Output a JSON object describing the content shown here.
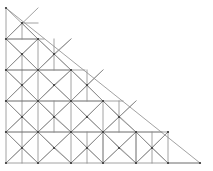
{
  "figure": {
    "name": "triangular-finite-element-mesh",
    "title": "",
    "background_color": "#ffffff",
    "line_color": "#8a8a8a",
    "node_color": "#3a3a3a",
    "line_width": 0.8,
    "node_radius": 1.1,
    "canvas": {
      "width": 213,
      "height": 171
    }
  },
  "mesh": {
    "domain_shape": "right-triangle",
    "apex": [
      6,
      8
    ],
    "bottom_left": [
      6,
      163
    ],
    "bottom_right": [
      200,
      163
    ],
    "grid_cell_width": 32.333,
    "grid_cell_height": 31.0,
    "columns": 6,
    "rows": 5,
    "description": "Unstructured triangular mesh on a right triangular domain, apex top-left, refined with diagonal and sub-diagonal elements",
    "segments": [
      [
        6,
        8,
        6,
        163
      ],
      [
        6,
        163,
        200,
        163
      ],
      [
        6,
        8,
        200,
        163
      ],
      [
        6,
        39,
        44,
        39
      ],
      [
        6,
        70,
        85,
        70
      ],
      [
        6,
        101,
        123,
        101
      ],
      [
        6,
        132,
        162,
        132
      ],
      [
        38,
        39,
        38,
        163
      ],
      [
        71,
        70,
        71,
        163
      ],
      [
        103,
        101,
        103,
        163
      ],
      [
        136,
        132,
        136,
        163
      ],
      [
        168,
        163,
        168,
        163
      ],
      [
        6,
        8,
        38,
        39
      ],
      [
        6,
        39,
        38,
        70
      ],
      [
        6,
        70,
        38,
        101
      ],
      [
        6,
        101,
        38,
        132
      ],
      [
        6,
        132,
        38,
        163
      ],
      [
        38,
        39,
        71,
        70
      ],
      [
        38,
        70,
        71,
        101
      ],
      [
        38,
        101,
        71,
        132
      ],
      [
        38,
        132,
        71,
        163
      ],
      [
        71,
        70,
        103,
        101
      ],
      [
        71,
        101,
        103,
        132
      ],
      [
        71,
        132,
        103,
        163
      ],
      [
        103,
        101,
        136,
        132
      ],
      [
        103,
        132,
        136,
        163
      ],
      [
        136,
        132,
        168,
        163
      ],
      [
        6,
        39,
        38,
        8
      ],
      [
        6,
        70,
        38,
        39
      ],
      [
        38,
        70,
        71,
        39
      ],
      [
        6,
        101,
        38,
        70
      ],
      [
        38,
        101,
        71,
        70
      ],
      [
        71,
        101,
        103,
        70
      ],
      [
        6,
        132,
        38,
        101
      ],
      [
        38,
        132,
        71,
        101
      ],
      [
        71,
        132,
        103,
        101
      ],
      [
        103,
        132,
        136,
        101
      ],
      [
        6,
        163,
        38,
        132
      ],
      [
        38,
        163,
        71,
        132
      ],
      [
        71,
        163,
        103,
        132
      ],
      [
        103,
        163,
        136,
        132
      ],
      [
        136,
        163,
        168,
        132
      ],
      [
        22,
        23,
        38,
        39
      ],
      [
        6,
        39,
        22,
        23
      ],
      [
        22,
        23,
        38,
        23
      ],
      [
        22,
        23,
        22,
        39
      ],
      [
        22,
        54,
        38,
        70
      ],
      [
        22,
        54,
        38,
        39
      ],
      [
        6,
        70,
        22,
        54
      ],
      [
        6,
        39,
        22,
        54
      ],
      [
        22,
        54,
        22,
        70
      ],
      [
        54,
        54,
        71,
        70
      ],
      [
        54,
        54,
        38,
        70
      ],
      [
        38,
        39,
        54,
        54
      ],
      [
        71,
        39,
        54,
        54
      ],
      [
        54,
        39,
        54,
        70
      ],
      [
        22,
        85,
        38,
        101
      ],
      [
        22,
        85,
        38,
        70
      ],
      [
        6,
        101,
        22,
        85
      ],
      [
        6,
        70,
        22,
        85
      ],
      [
        22,
        70,
        22,
        101
      ],
      [
        54,
        85,
        71,
        101
      ],
      [
        54,
        85,
        38,
        101
      ],
      [
        38,
        70,
        54,
        85
      ],
      [
        71,
        70,
        54,
        85
      ],
      [
        87,
        85,
        103,
        101
      ],
      [
        87,
        85,
        71,
        101
      ],
      [
        71,
        70,
        87,
        85
      ],
      [
        103,
        70,
        87,
        85
      ],
      [
        87,
        70,
        87,
        101
      ],
      [
        22,
        117,
        38,
        132
      ],
      [
        22,
        117,
        38,
        101
      ],
      [
        6,
        132,
        22,
        117
      ],
      [
        6,
        101,
        22,
        117
      ],
      [
        22,
        101,
        22,
        132
      ],
      [
        54,
        117,
        71,
        132
      ],
      [
        54,
        117,
        38,
        132
      ],
      [
        38,
        101,
        54,
        117
      ],
      [
        71,
        101,
        54,
        117
      ],
      [
        54,
        101,
        54,
        132
      ],
      [
        87,
        117,
        103,
        132
      ],
      [
        87,
        117,
        71,
        132
      ],
      [
        71,
        101,
        87,
        117
      ],
      [
        103,
        101,
        87,
        117
      ],
      [
        119,
        117,
        136,
        132
      ],
      [
        119,
        117,
        103,
        132
      ],
      [
        103,
        101,
        119,
        117
      ],
      [
        136,
        101,
        119,
        117
      ],
      [
        119,
        101,
        119,
        132
      ],
      [
        22,
        148,
        38,
        163
      ],
      [
        22,
        148,
        38,
        132
      ],
      [
        6,
        163,
        22,
        148
      ],
      [
        6,
        132,
        22,
        148
      ],
      [
        22,
        132,
        22,
        163
      ],
      [
        54,
        148,
        71,
        163
      ],
      [
        54,
        148,
        38,
        163
      ],
      [
        38,
        132,
        54,
        148
      ],
      [
        71,
        132,
        54,
        148
      ],
      [
        87,
        148,
        103,
        163
      ],
      [
        87,
        148,
        71,
        163
      ],
      [
        71,
        132,
        87,
        148
      ],
      [
        103,
        132,
        87,
        148
      ],
      [
        87,
        132,
        87,
        163
      ],
      [
        119,
        148,
        136,
        163
      ],
      [
        119,
        148,
        103,
        163
      ],
      [
        103,
        132,
        119,
        148
      ],
      [
        136,
        132,
        119,
        148
      ],
      [
        152,
        148,
        168,
        163
      ],
      [
        152,
        148,
        136,
        163
      ],
      [
        136,
        132,
        152,
        148
      ],
      [
        168,
        132,
        152,
        148
      ],
      [
        152,
        132,
        152,
        163
      ],
      [
        103,
        132,
        136,
        132
      ],
      [
        136,
        132,
        136,
        163
      ],
      [
        103,
        132,
        103,
        163
      ],
      [
        168,
        163,
        200,
        163
      ],
      [
        168,
        132,
        168,
        163
      ],
      [
        6,
        101,
        38,
        101
      ],
      [
        38,
        101,
        71,
        101
      ],
      [
        71,
        101,
        103,
        101
      ],
      [
        6,
        70,
        38,
        70
      ],
      [
        38,
        70,
        71,
        70
      ],
      [
        6,
        39,
        38,
        39
      ],
      [
        6,
        132,
        38,
        132
      ],
      [
        38,
        132,
        71,
        132
      ],
      [
        71,
        132,
        103,
        132
      ],
      [
        136,
        132,
        168,
        132
      ]
    ],
    "nodes": [
      [
        6,
        8
      ],
      [
        6,
        39
      ],
      [
        6,
        70
      ],
      [
        6,
        101
      ],
      [
        6,
        132
      ],
      [
        6,
        163
      ],
      [
        38,
        39
      ],
      [
        38,
        70
      ],
      [
        38,
        101
      ],
      [
        38,
        132
      ],
      [
        38,
        163
      ],
      [
        71,
        70
      ],
      [
        71,
        101
      ],
      [
        71,
        132
      ],
      [
        71,
        163
      ],
      [
        103,
        101
      ],
      [
        103,
        132
      ],
      [
        103,
        163
      ],
      [
        136,
        132
      ],
      [
        136,
        163
      ],
      [
        168,
        163
      ],
      [
        200,
        163
      ],
      [
        22,
        23
      ],
      [
        22,
        54
      ],
      [
        22,
        85
      ],
      [
        22,
        117
      ],
      [
        22,
        148
      ],
      [
        54,
        54
      ],
      [
        54,
        85
      ],
      [
        54,
        117
      ],
      [
        54,
        148
      ],
      [
        87,
        85
      ],
      [
        87,
        117
      ],
      [
        87,
        148
      ],
      [
        119,
        117
      ],
      [
        119,
        148
      ],
      [
        152,
        148
      ],
      [
        168,
        132
      ]
    ]
  }
}
